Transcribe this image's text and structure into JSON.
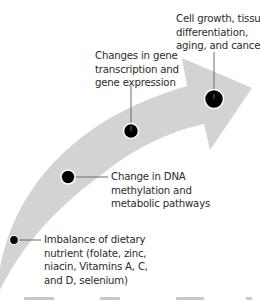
{
  "diagram": {
    "type": "curved-arrow-progression",
    "arrow_color": "#d3d3d3",
    "dot_color": "#000000",
    "connector_color": "#6a6a6a",
    "text_color": "#2b2b2b",
    "stages": [
      {
        "id": "stage-1",
        "lines": [
          "Imbalance of dietary",
          "nutrient (folate, zinc,",
          "niacin, Vitamins A, C,",
          "and D, selenium)"
        ]
      },
      {
        "id": "stage-2",
        "lines": [
          "Change in DNA",
          "methylation and",
          "metabolic pathways"
        ]
      },
      {
        "id": "stage-3",
        "lines": [
          "Changes in gene",
          "transcription and",
          "gene expression"
        ]
      },
      {
        "id": "stage-4",
        "lines": [
          "Cell growth, tissue",
          "differentiation,",
          "aging, and cancer"
        ]
      }
    ]
  }
}
